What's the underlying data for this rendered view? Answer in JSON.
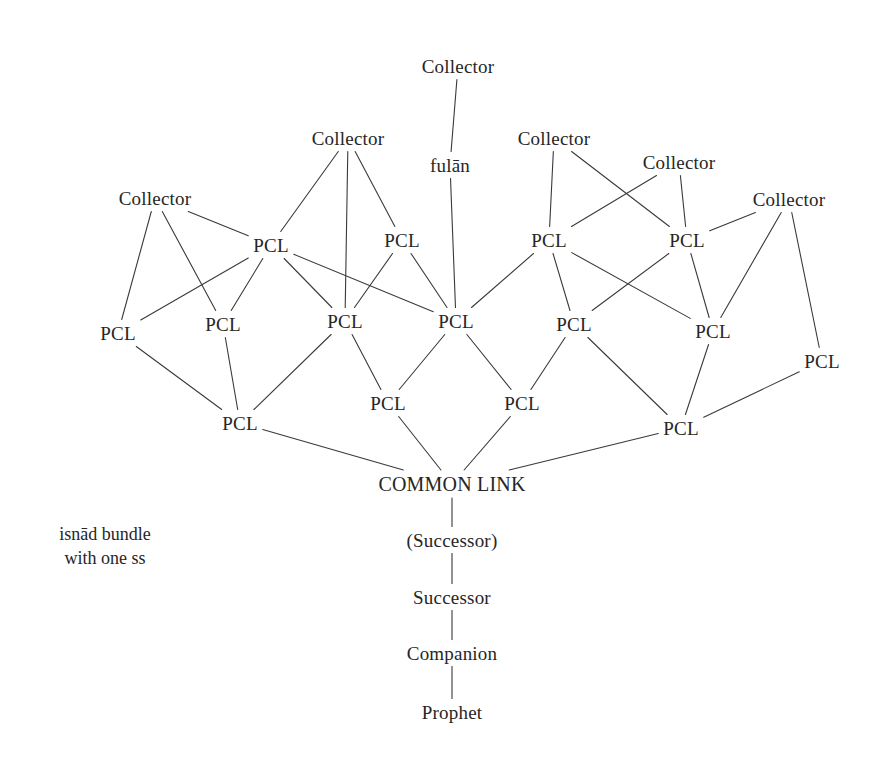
{
  "diagram": {
    "caption": "isnād bundle\nwith one ss",
    "caption_x": 105,
    "caption_y": 522,
    "background_color": "#ffffff",
    "line_color": "#3a3a3a",
    "text_color": "#262626",
    "line_width": 1.1,
    "width": 893,
    "height": 758,
    "labels": {
      "collector": "Collector",
      "pcl": "PCL",
      "fulan": "fulān",
      "common_link": "COMMON LINK",
      "successor_paren": "(Successor)",
      "successor": "Successor",
      "companion": "Companion",
      "prophet": "Prophet"
    },
    "nodes": [
      {
        "id": "c_top",
        "label": "Collector",
        "kind": "collector",
        "x": 458,
        "y": 66
      },
      {
        "id": "c1",
        "label": "Collector",
        "kind": "collector",
        "x": 155,
        "y": 198
      },
      {
        "id": "c2",
        "label": "Collector",
        "kind": "collector",
        "x": 348,
        "y": 138
      },
      {
        "id": "c3",
        "label": "Collector",
        "kind": "collector",
        "x": 554,
        "y": 138
      },
      {
        "id": "c4",
        "label": "Collector",
        "kind": "collector",
        "x": 679,
        "y": 162
      },
      {
        "id": "c5",
        "label": "Collector",
        "kind": "collector",
        "x": 789,
        "y": 199
      },
      {
        "id": "fulan",
        "label": "fulān",
        "kind": "fulan",
        "x": 450,
        "y": 165
      },
      {
        "id": "p_a1",
        "label": "PCL",
        "kind": "pcl",
        "x": 271,
        "y": 245
      },
      {
        "id": "p_a2",
        "label": "PCL",
        "kind": "pcl",
        "x": 402,
        "y": 240
      },
      {
        "id": "p_a3",
        "label": "PCL",
        "kind": "pcl",
        "x": 549,
        "y": 240
      },
      {
        "id": "p_a4",
        "label": "PCL",
        "kind": "pcl",
        "x": 687,
        "y": 240
      },
      {
        "id": "p_b1",
        "label": "PCL",
        "kind": "pcl",
        "x": 118,
        "y": 333
      },
      {
        "id": "p_b2",
        "label": "PCL",
        "kind": "pcl",
        "x": 223,
        "y": 324
      },
      {
        "id": "p_b3",
        "label": "PCL",
        "kind": "pcl",
        "x": 345,
        "y": 321
      },
      {
        "id": "p_b4",
        "label": "PCL",
        "kind": "pcl",
        "x": 456,
        "y": 321
      },
      {
        "id": "p_b5",
        "label": "PCL",
        "kind": "pcl",
        "x": 574,
        "y": 324
      },
      {
        "id": "p_b6",
        "label": "PCL",
        "kind": "pcl",
        "x": 713,
        "y": 331
      },
      {
        "id": "p_b7",
        "label": "PCL",
        "kind": "pcl",
        "x": 822,
        "y": 361
      },
      {
        "id": "p_c1",
        "label": "PCL",
        "kind": "pcl",
        "x": 240,
        "y": 423
      },
      {
        "id": "p_c2",
        "label": "PCL",
        "kind": "pcl",
        "x": 388,
        "y": 403
      },
      {
        "id": "p_c3",
        "label": "PCL",
        "kind": "pcl",
        "x": 522,
        "y": 403
      },
      {
        "id": "p_c4",
        "label": "PCL",
        "kind": "pcl",
        "x": 681,
        "y": 428
      },
      {
        "id": "cl",
        "label": "COMMON LINK",
        "kind": "cl",
        "x": 452,
        "y": 484
      },
      {
        "id": "succ_p",
        "label": "(Successor)",
        "kind": "chain",
        "x": 452,
        "y": 540
      },
      {
        "id": "succ",
        "label": "Successor",
        "kind": "chain",
        "x": 452,
        "y": 597
      },
      {
        "id": "comp",
        "label": "Companion",
        "kind": "chain",
        "x": 452,
        "y": 653
      },
      {
        "id": "proph",
        "label": "Prophet",
        "kind": "chain",
        "x": 452,
        "y": 712
      }
    ],
    "edges": [
      {
        "from": "c_top",
        "to": "fulan"
      },
      {
        "from": "fulan",
        "to": "p_b4"
      },
      {
        "from": "c1",
        "to": "p_b1"
      },
      {
        "from": "c1",
        "to": "p_b2"
      },
      {
        "from": "c1",
        "to": "p_a1"
      },
      {
        "from": "c2",
        "to": "p_a1"
      },
      {
        "from": "c2",
        "to": "p_b3"
      },
      {
        "from": "c2",
        "to": "p_a2"
      },
      {
        "from": "c3",
        "to": "p_a3"
      },
      {
        "from": "c3",
        "to": "p_a4"
      },
      {
        "from": "c4",
        "to": "p_a4"
      },
      {
        "from": "c4",
        "to": "p_a3"
      },
      {
        "from": "c5",
        "to": "p_a4"
      },
      {
        "from": "c5",
        "to": "p_b6"
      },
      {
        "from": "c5",
        "to": "p_b7"
      },
      {
        "from": "p_a1",
        "to": "p_b1"
      },
      {
        "from": "p_a1",
        "to": "p_b2"
      },
      {
        "from": "p_a1",
        "to": "p_b3"
      },
      {
        "from": "p_a1",
        "to": "p_b4"
      },
      {
        "from": "p_a2",
        "to": "p_b3"
      },
      {
        "from": "p_a2",
        "to": "p_b4"
      },
      {
        "from": "p_a3",
        "to": "p_b4"
      },
      {
        "from": "p_a3",
        "to": "p_b5"
      },
      {
        "from": "p_a3",
        "to": "p_b6"
      },
      {
        "from": "p_a4",
        "to": "p_b5"
      },
      {
        "from": "p_a4",
        "to": "p_b6"
      },
      {
        "from": "p_b1",
        "to": "p_c1"
      },
      {
        "from": "p_b2",
        "to": "p_c1"
      },
      {
        "from": "p_b3",
        "to": "p_c1"
      },
      {
        "from": "p_b3",
        "to": "p_c2"
      },
      {
        "from": "p_b4",
        "to": "p_c2"
      },
      {
        "from": "p_b4",
        "to": "p_c3"
      },
      {
        "from": "p_b5",
        "to": "p_c3"
      },
      {
        "from": "p_b5",
        "to": "p_c4"
      },
      {
        "from": "p_b6",
        "to": "p_c4"
      },
      {
        "from": "p_b7",
        "to": "p_c4"
      },
      {
        "from": "p_c1",
        "to": "cl"
      },
      {
        "from": "p_c2",
        "to": "cl"
      },
      {
        "from": "p_c3",
        "to": "cl"
      },
      {
        "from": "p_c4",
        "to": "cl"
      },
      {
        "from": "cl",
        "to": "succ_p"
      },
      {
        "from": "succ_p",
        "to": "succ"
      },
      {
        "from": "succ",
        "to": "comp"
      },
      {
        "from": "comp",
        "to": "proph"
      }
    ]
  }
}
